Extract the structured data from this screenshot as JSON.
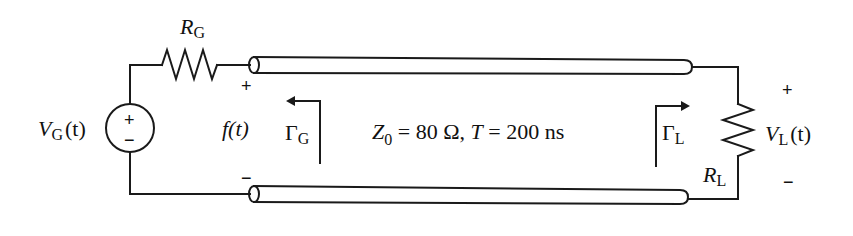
{
  "diagram": {
    "source": {
      "label": "V",
      "label_sub": "G",
      "label_arg": "(t)",
      "plus": "+",
      "minus": "−"
    },
    "generator_resistor": {
      "label": "R",
      "label_sub": "G"
    },
    "line_input": {
      "plus": "+",
      "minus": "−",
      "voltage_label": "f(t)"
    },
    "reflection_generator": {
      "label": "Γ",
      "label_sub": "G"
    },
    "line_parameters": {
      "z0_symbol": "Z",
      "z0_sub": "0",
      "z0_value": " = 80 Ω, ",
      "t_symbol": "T",
      "t_value": " = 200 ns"
    },
    "reflection_load": {
      "label": "Γ",
      "label_sub": "L"
    },
    "load_resistor": {
      "label": "R",
      "label_sub": "L"
    },
    "load_voltage": {
      "label": "V",
      "label_sub": "L",
      "label_arg": "(t)",
      "plus": "+",
      "minus": "−"
    },
    "colors": {
      "stroke": "#1a1a1a",
      "background": "#ffffff"
    }
  }
}
